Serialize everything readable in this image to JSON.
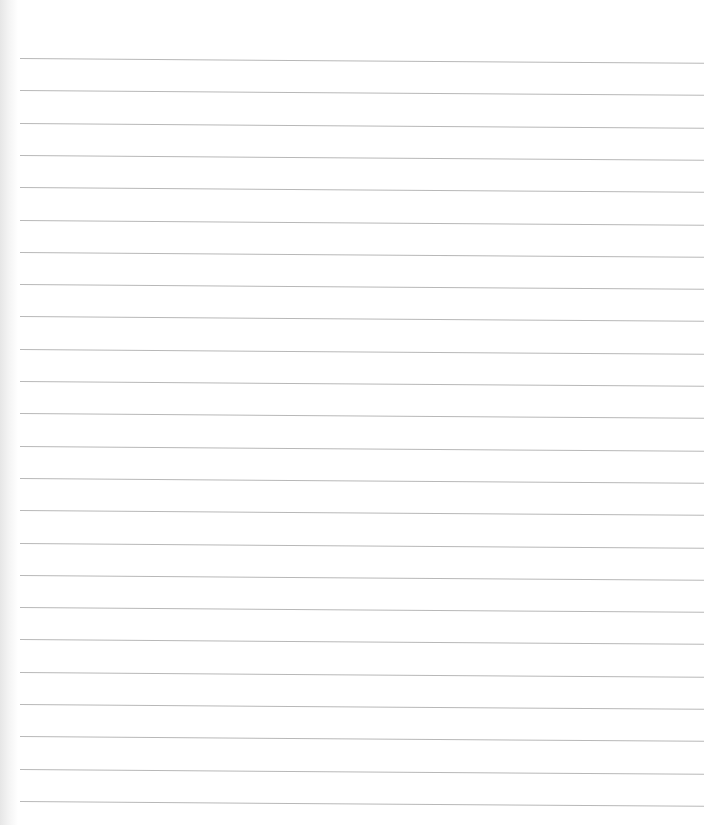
{
  "paper": {
    "type": "lined-paper",
    "background": "#ffffff",
    "line_color": "#b8b8b8",
    "line_count": 24,
    "first_line_y": 58,
    "line_spacing": 32.3,
    "line_left_x": 20,
    "line_right_x": 704,
    "content_text": ""
  }
}
